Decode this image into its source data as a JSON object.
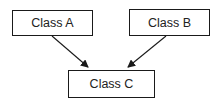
{
  "diagram": {
    "type": "class-diagram",
    "nodes": [
      {
        "id": "A",
        "label": "Class A"
      },
      {
        "id": "B",
        "label": "Class B"
      },
      {
        "id": "C",
        "label": "Class C"
      }
    ],
    "edges": [
      {
        "from": "A",
        "to": "C"
      },
      {
        "from": "B",
        "to": "C"
      }
    ],
    "colors": {
      "stroke": "#1a1a1a",
      "text": "#222222",
      "background": "#ffffff"
    }
  }
}
